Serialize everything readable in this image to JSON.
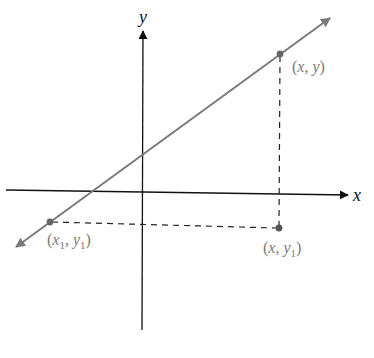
{
  "diagram": {
    "type": "coordinate-plane",
    "colors": {
      "axis": "#111111",
      "line": "#7a7a7a",
      "point": "#666666",
      "dashed": "#222222",
      "label": "#7a7a7a"
    },
    "axes": {
      "x_label": "x",
      "y_label": "y"
    },
    "points": [
      {
        "name": "point-x-y",
        "var": "x",
        "sep": ", ",
        "var2": "y",
        "sub1": "",
        "sub2": ""
      },
      {
        "name": "point-x1-y1",
        "var": "x",
        "sep": ", ",
        "var2": "y",
        "sub1": "1",
        "sub2": "1"
      },
      {
        "name": "point-x-y1",
        "var": "x",
        "sep": ", ",
        "var2": "y",
        "sub1": "",
        "sub2": "1"
      }
    ],
    "open_paren": "(",
    "close_paren": ")"
  }
}
